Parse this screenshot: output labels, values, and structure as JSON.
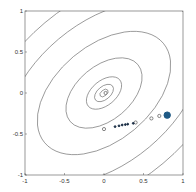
{
  "chart_data": {
    "type": "scatter",
    "title": "",
    "xlabel": "",
    "ylabel": "",
    "xlim": [
      -1,
      1
    ],
    "ylim": [
      -1,
      1
    ],
    "grid": false,
    "legend": null,
    "x_ticks": [
      "-1",
      "-0.5",
      "0",
      "0.5",
      "1"
    ],
    "y_ticks": [
      "1",
      "0.5",
      "0",
      "-0.5",
      "-1"
    ],
    "contours": {
      "center": [
        0,
        0
      ],
      "rotation_deg": -40,
      "ellipses": [
        {
          "rx": 0.06,
          "ry": 0.035
        },
        {
          "rx": 0.14,
          "ry": 0.08
        },
        {
          "rx": 0.26,
          "ry": 0.15
        },
        {
          "rx": 0.56,
          "ry": 0.33
        },
        {
          "rx": 0.98,
          "ry": 0.58
        },
        {
          "rx": 1.45,
          "ry": 0.86
        },
        {
          "rx": 1.9,
          "ry": 1.12
        }
      ],
      "color": "#666666"
    },
    "series": [
      {
        "name": "start",
        "style": "filled",
        "color": "#1f5a85",
        "r": 3.2,
        "points": [
          [
            0.8,
            -0.27
          ]
        ]
      },
      {
        "name": "iterates-open",
        "style": "open",
        "color": "#555555",
        "r": 1.6,
        "points": [
          [
            0.7,
            -0.28
          ],
          [
            0.6,
            -0.31
          ],
          [
            0.4,
            -0.36
          ],
          [
            0.0,
            -0.44
          ],
          [
            0.02,
            0.0
          ]
        ]
      },
      {
        "name": "iterates-dark",
        "style": "filled",
        "color": "#1a2e45",
        "r": 0.9,
        "points": [
          [
            0.14,
            -0.41
          ],
          [
            0.19,
            -0.4
          ],
          [
            0.23,
            -0.39
          ],
          [
            0.27,
            -0.385
          ],
          [
            0.3,
            -0.38
          ],
          [
            0.37,
            -0.37
          ]
        ]
      }
    ]
  }
}
